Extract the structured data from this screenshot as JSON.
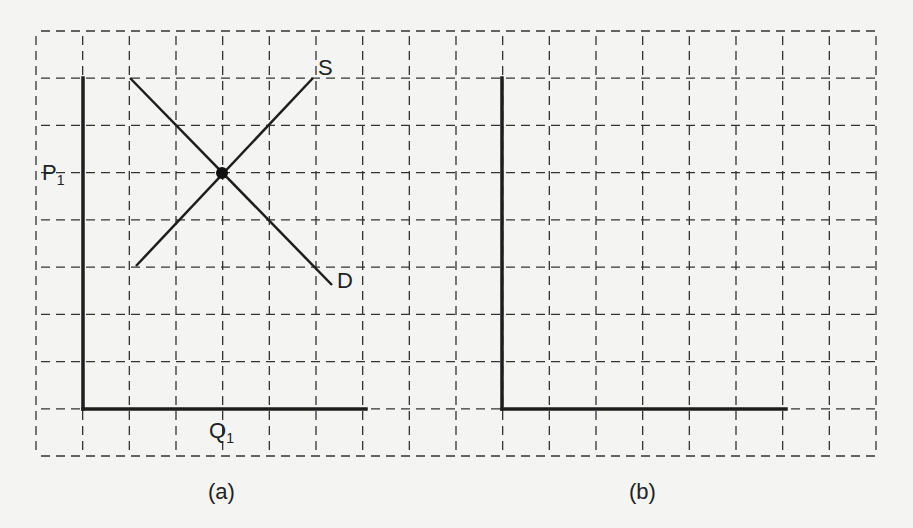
{
  "colors": {
    "background": "#f4f4f2",
    "ink": "#1e1e1e",
    "grid": "#333333"
  },
  "grid": {
    "x_start": 36,
    "x_end": 876,
    "x_step": 46.67,
    "y_start": 31,
    "y_end": 456,
    "y_step": 47.2,
    "style": "dashed"
  },
  "panels": [
    {
      "id": "a",
      "caption": "(a)",
      "axes": {
        "origin": [
          83,
          409
        ],
        "y_top": [
          83,
          78
        ],
        "x_right": [
          366,
          409
        ]
      },
      "curves": [
        {
          "name": "S",
          "label": "S",
          "from": [
            136,
            266
          ],
          "to": [
            313,
            78
          ],
          "type": "supply"
        },
        {
          "name": "D",
          "label": "D",
          "from": [
            130,
            78
          ],
          "to": [
            332,
            285
          ],
          "type": "demand"
        }
      ],
      "equilibrium": {
        "point": [
          222,
          173
        ],
        "price_label": "P",
        "price_sub": "1",
        "quantity_label": "Q",
        "quantity_sub": "1"
      }
    },
    {
      "id": "b",
      "caption": "(b)",
      "axes": {
        "origin": [
          502,
          409
        ],
        "y_top": [
          502,
          78
        ],
        "x_right": [
          786,
          409
        ]
      },
      "curves": []
    }
  ],
  "labels": {
    "s": "S",
    "d": "D",
    "p": "P",
    "p_sub": "1",
    "q": "Q",
    "q_sub": "1",
    "caption_a": "(a)",
    "caption_b": "(b)"
  }
}
